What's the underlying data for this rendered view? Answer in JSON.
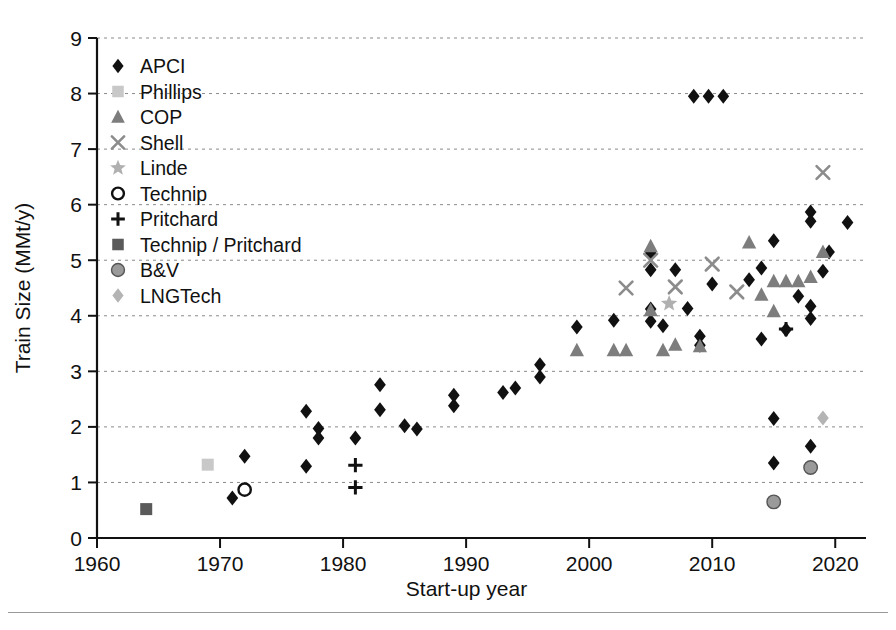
{
  "chart": {
    "type": "scatter",
    "title": "",
    "xlabel": "Start-up year",
    "ylabel": "Train Size  (MMt/y)",
    "xlim": [
      1960,
      2022.5
    ],
    "ylim": [
      0,
      9
    ],
    "xticks": [
      "1960",
      "1970",
      "1980",
      "1990",
      "2000",
      "2010",
      "2020"
    ],
    "xtick_values": [
      1960,
      1970,
      1980,
      1990,
      2000,
      2010,
      2020
    ],
    "yticks": [
      "0",
      "1",
      "2",
      "3",
      "4",
      "5",
      "6",
      "7",
      "8",
      "9"
    ],
    "ytick_values": [
      0,
      1,
      2,
      3,
      4,
      5,
      6,
      7,
      8,
      9
    ],
    "grid": "horizontal-dotted",
    "legend_position": "upper-left"
  },
  "legend": {
    "items": [
      {
        "label": "APCI",
        "marker": "diamond",
        "color": "#111111"
      },
      {
        "label": "Phillips",
        "marker": "square",
        "color": "#c8c8c8"
      },
      {
        "label": "COP",
        "marker": "triangle",
        "color": "#7d7d7d"
      },
      {
        "label": "Shell",
        "marker": "cross-x",
        "color": "#8c8c8c"
      },
      {
        "label": "Linde",
        "marker": "star",
        "color": "#b0b0b0"
      },
      {
        "label": "Technip",
        "marker": "circle-open",
        "color": "#111111"
      },
      {
        "label": "Pritchard",
        "marker": "plus",
        "color": "#111111"
      },
      {
        "label": "Technip / Pritchard",
        "marker": "square",
        "color": "#5a5a5a"
      },
      {
        "label": "B&V",
        "marker": "circle",
        "color": "#9a9a9a"
      },
      {
        "label": "LNGTech",
        "marker": "diamond",
        "color": "#b4b4b4"
      }
    ]
  },
  "chart_data": {
    "type": "scatter",
    "title": "",
    "xlabel": "Start-up year",
    "ylabel": "Train Size  (MMt/y)",
    "xlim": [
      1960,
      2022.5
    ],
    "ylim": [
      0,
      9
    ],
    "grid": "horizontal gridlines only, dotted",
    "legend_position": "upper left inside axes",
    "series": [
      {
        "name": "APCI",
        "marker": "diamond",
        "color": "#111111",
        "points": [
          [
            1971.0,
            0.72
          ],
          [
            1972.0,
            1.47
          ],
          [
            1977.0,
            2.28
          ],
          [
            1977.0,
            1.29
          ],
          [
            1978.0,
            1.97
          ],
          [
            1978.0,
            1.8
          ],
          [
            1981.0,
            1.8
          ],
          [
            1983.0,
            2.76
          ],
          [
            1983.0,
            2.31
          ],
          [
            1985.0,
            2.02
          ],
          [
            1986.0,
            1.96
          ],
          [
            1989.0,
            2.57
          ],
          [
            1989.0,
            2.38
          ],
          [
            1993.0,
            2.62
          ],
          [
            1994.0,
            2.7
          ],
          [
            1996.0,
            3.12
          ],
          [
            1996.0,
            2.9
          ],
          [
            1999.0,
            3.8
          ],
          [
            2002.0,
            3.92
          ],
          [
            2005.0,
            5.13
          ],
          [
            2005.0,
            4.83
          ],
          [
            2005.0,
            4.12
          ],
          [
            2005.0,
            3.9
          ],
          [
            2006.0,
            3.82
          ],
          [
            2007.0,
            4.83
          ],
          [
            2008.0,
            4.13
          ],
          [
            2009.0,
            3.63
          ],
          [
            2009.0,
            3.47
          ],
          [
            2008.5,
            7.95
          ],
          [
            2009.7,
            7.95
          ],
          [
            2010.9,
            7.95
          ],
          [
            2010.0,
            4.57
          ],
          [
            2013.0,
            4.65
          ],
          [
            2014.0,
            4.86
          ],
          [
            2014.0,
            3.58
          ],
          [
            2015.0,
            5.35
          ],
          [
            2015.0,
            2.15
          ],
          [
            2015.0,
            1.35
          ],
          [
            2016.0,
            3.75
          ],
          [
            2018.0,
            5.87
          ],
          [
            2018.0,
            5.7
          ],
          [
            2018.0,
            4.17
          ],
          [
            2018.0,
            3.95
          ],
          [
            2018.0,
            1.65
          ],
          [
            2017.0,
            4.35
          ],
          [
            2019.0,
            4.8
          ],
          [
            2019.5,
            5.15
          ],
          [
            2021.0,
            5.68
          ]
        ]
      },
      {
        "name": "Phillips",
        "marker": "square",
        "color": "#c8c8c8",
        "points": [
          [
            1969.0,
            1.32
          ]
        ]
      },
      {
        "name": "COP",
        "marker": "triangle",
        "color": "#7d7d7d",
        "points": [
          [
            1999.0,
            3.38
          ],
          [
            2002.0,
            3.38
          ],
          [
            2003.0,
            3.38
          ],
          [
            2005.0,
            5.25
          ],
          [
            2005.0,
            4.1
          ],
          [
            2006.0,
            3.38
          ],
          [
            2007.0,
            3.48
          ],
          [
            2009.0,
            3.45
          ],
          [
            2013.0,
            5.32
          ],
          [
            2014.0,
            4.38
          ],
          [
            2015.0,
            4.62
          ],
          [
            2015.0,
            4.08
          ],
          [
            2016.0,
            4.62
          ],
          [
            2017.0,
            4.62
          ],
          [
            2018.0,
            4.7
          ],
          [
            2019.0,
            5.15
          ]
        ]
      },
      {
        "name": "Shell",
        "marker": "cross-x",
        "color": "#8c8c8c",
        "points": [
          [
            2003.0,
            4.5
          ],
          [
            2005.0,
            5.0
          ],
          [
            2007.0,
            4.52
          ],
          [
            2010.0,
            4.93
          ],
          [
            2012.0,
            4.43
          ],
          [
            2019.0,
            6.58
          ]
        ]
      },
      {
        "name": "Linde",
        "marker": "star",
        "color": "#b0b0b0",
        "points": [
          [
            2006.5,
            4.22
          ]
        ]
      },
      {
        "name": "Technip",
        "marker": "circle-open",
        "color": "#111111",
        "points": [
          [
            1972.0,
            0.87
          ]
        ]
      },
      {
        "name": "Pritchard",
        "marker": "plus",
        "color": "#111111",
        "points": [
          [
            1981.0,
            1.31
          ],
          [
            1981.0,
            0.91
          ],
          [
            2016.0,
            3.76
          ]
        ]
      },
      {
        "name": "Technip / Pritchard",
        "marker": "square",
        "color": "#5a5a5a",
        "points": [
          [
            1964.0,
            0.52
          ]
        ]
      },
      {
        "name": "B&V",
        "marker": "circle",
        "color": "#9a9a9a",
        "points": [
          [
            2015.0,
            0.65
          ],
          [
            2018.0,
            1.27
          ]
        ]
      },
      {
        "name": "LNGTech",
        "marker": "diamond",
        "color": "#b4b4b4",
        "points": [
          [
            2019.0,
            2.16
          ]
        ]
      }
    ]
  }
}
